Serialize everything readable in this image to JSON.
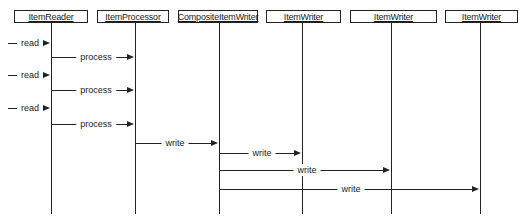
{
  "diagram": {
    "type": "sequence",
    "participants": [
      {
        "id": "itemReader",
        "label": "ItemReader",
        "x": 14,
        "w": 74,
        "lifeline_x": 51
      },
      {
        "id": "itemProcessor",
        "label": "ItemProcessor",
        "x": 97,
        "w": 72,
        "lifeline_x": 135
      },
      {
        "id": "compositeItemWriter",
        "label": "CompositeItemWriter",
        "x": 178,
        "w": 80,
        "lifeline_x": 219
      },
      {
        "id": "itemWriter1",
        "label": "ItemWriter",
        "x": 266,
        "w": 75,
        "lifeline_x": 302
      },
      {
        "id": "itemWriter2",
        "label": "ItemWriter",
        "x": 350,
        "w": 87,
        "lifeline_x": 391
      },
      {
        "id": "itemWriter3",
        "label": "ItemWriter",
        "x": 445,
        "w": 73,
        "lifeline_x": 480
      }
    ],
    "messages": [
      {
        "label": "read",
        "from": "external",
        "to": "itemReader",
        "y": 43,
        "x1": 8,
        "x2": 50,
        "label_x": 30
      },
      {
        "label": "process",
        "from": "itemReader",
        "to": "itemProcessor",
        "y": 57,
        "x1": 51,
        "x2": 134,
        "label_x": 96
      },
      {
        "label": "read",
        "from": "external",
        "to": "itemReader",
        "y": 75,
        "x1": 8,
        "x2": 50,
        "label_x": 30
      },
      {
        "label": "process",
        "from": "itemReader",
        "to": "itemProcessor",
        "y": 90,
        "x1": 51,
        "x2": 134,
        "label_x": 96
      },
      {
        "label": "read",
        "from": "external",
        "to": "itemReader",
        "y": 108,
        "x1": 8,
        "x2": 50,
        "label_x": 30
      },
      {
        "label": "process",
        "from": "itemReader",
        "to": "itemProcessor",
        "y": 124,
        "x1": 51,
        "x2": 134,
        "label_x": 96
      },
      {
        "label": "write",
        "from": "itemProcessor",
        "to": "compositeItemWriter",
        "y": 143,
        "x1": 135,
        "x2": 218,
        "label_x": 175
      },
      {
        "label": "write",
        "from": "compositeItemWriter",
        "to": "itemWriter1",
        "y": 153,
        "x1": 219,
        "x2": 301,
        "label_x": 262
      },
      {
        "label": "write",
        "from": "compositeItemWriter",
        "to": "itemWriter2",
        "y": 170,
        "x1": 219,
        "x2": 390,
        "label_x": 307
      },
      {
        "label": "write",
        "from": "compositeItemWriter",
        "to": "itemWriter3",
        "y": 189,
        "x1": 219,
        "x2": 479,
        "label_x": 351
      }
    ]
  }
}
